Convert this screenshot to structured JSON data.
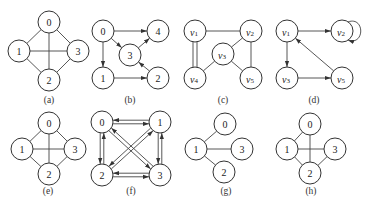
{
  "figure": {
    "panels": [
      {
        "id": "a",
        "caption": "(a)",
        "directed": false,
        "nodes": [
          {
            "id": "0",
            "label": "0",
            "x": 49,
            "y": 22
          },
          {
            "id": "1",
            "label": "1",
            "x": 19,
            "y": 51
          },
          {
            "id": "3",
            "label": "3",
            "x": 78,
            "y": 51
          },
          {
            "id": "2",
            "label": "2",
            "x": 49,
            "y": 80
          }
        ],
        "edges": [
          [
            "0",
            "1"
          ],
          [
            "0",
            "3"
          ],
          [
            "0",
            "2"
          ],
          [
            "1",
            "3"
          ],
          [
            "1",
            "2"
          ],
          [
            "2",
            "3"
          ]
        ],
        "caption_pos": {
          "x": 49,
          "y": 103
        }
      },
      {
        "id": "b",
        "caption": "(b)",
        "directed": true,
        "nodes": [
          {
            "id": "0",
            "label": "0",
            "x": 103,
            "y": 31
          },
          {
            "id": "4",
            "label": "4",
            "x": 158,
            "y": 31
          },
          {
            "id": "3",
            "label": "3",
            "x": 130,
            "y": 55
          },
          {
            "id": "1",
            "label": "1",
            "x": 103,
            "y": 78
          },
          {
            "id": "2",
            "label": "2",
            "x": 158,
            "y": 78
          }
        ],
        "edges": [
          [
            "0",
            "4"
          ],
          [
            "0",
            "3"
          ],
          [
            "0",
            "1"
          ],
          [
            "3",
            "4"
          ],
          [
            "2",
            "3"
          ],
          [
            "1",
            "2"
          ]
        ],
        "caption_pos": {
          "x": 130,
          "y": 103
        }
      },
      {
        "id": "c",
        "caption": "(c)",
        "directed": false,
        "nodes": [
          {
            "id": "v1",
            "label": "v",
            "sub": "1",
            "x": 195,
            "y": 31
          },
          {
            "id": "v2",
            "label": "v",
            "sub": "2",
            "x": 251,
            "y": 31
          },
          {
            "id": "v3",
            "label": "v",
            "sub": "3",
            "x": 223,
            "y": 54
          },
          {
            "id": "v4",
            "label": "v",
            "sub": "4",
            "x": 195,
            "y": 78
          },
          {
            "id": "v5",
            "label": "v",
            "sub": "5",
            "x": 251,
            "y": 78
          }
        ],
        "edges": [
          [
            "v1",
            "v2"
          ],
          [
            "v2",
            "v3"
          ],
          [
            "v2",
            "v5"
          ],
          [
            "v3",
            "v4"
          ],
          [
            "v3",
            "v5"
          ]
        ],
        "double_edges": [
          [
            "v1",
            "v4"
          ]
        ],
        "caption_pos": {
          "x": 223,
          "y": 103
        }
      },
      {
        "id": "d",
        "caption": "(d)",
        "directed": true,
        "nodes": [
          {
            "id": "v1",
            "label": "v",
            "sub": "1",
            "x": 287,
            "y": 31
          },
          {
            "id": "v2",
            "label": "v",
            "sub": "2",
            "x": 342,
            "y": 31
          },
          {
            "id": "v3",
            "label": "v",
            "sub": "3",
            "x": 287,
            "y": 78
          },
          {
            "id": "v5",
            "label": "v",
            "sub": "5",
            "x": 342,
            "y": 78
          }
        ],
        "edges": [
          [
            "v1",
            "v2"
          ],
          [
            "v1",
            "v3"
          ],
          [
            "v3",
            "v5"
          ],
          [
            "v5",
            "v1"
          ]
        ],
        "self_loops": [
          "v2"
        ],
        "caption_pos": {
          "x": 314,
          "y": 103
        }
      },
      {
        "id": "e",
        "caption": "(e)",
        "directed": false,
        "nodes": [
          {
            "id": "0",
            "label": "0",
            "x": 49,
            "y": 123
          },
          {
            "id": "1",
            "label": "1",
            "x": 22,
            "y": 149
          },
          {
            "id": "3",
            "label": "3",
            "x": 75,
            "y": 149
          },
          {
            "id": "2",
            "label": "2",
            "x": 49,
            "y": 174
          }
        ],
        "edges": [
          [
            "0",
            "1"
          ],
          [
            "0",
            "3"
          ],
          [
            "0",
            "2"
          ],
          [
            "1",
            "3"
          ],
          [
            "1",
            "2"
          ],
          [
            "2",
            "3"
          ]
        ],
        "caption_pos": {
          "x": 48,
          "y": 194
        }
      },
      {
        "id": "f",
        "caption": "(f)",
        "directed": true,
        "bidirectional": true,
        "nodes": [
          {
            "id": "0",
            "label": "0",
            "x": 102,
            "y": 122
          },
          {
            "id": "1",
            "label": "1",
            "x": 160,
            "y": 122
          },
          {
            "id": "2",
            "label": "2",
            "x": 102,
            "y": 175
          },
          {
            "id": "3",
            "label": "3",
            "x": 160,
            "y": 175
          }
        ],
        "edges": [
          [
            "0",
            "1"
          ],
          [
            "0",
            "2"
          ],
          [
            "0",
            "3"
          ],
          [
            "1",
            "2"
          ],
          [
            "1",
            "3"
          ],
          [
            "2",
            "3"
          ]
        ],
        "caption_pos": {
          "x": 131,
          "y": 194
        }
      },
      {
        "id": "g",
        "caption": "(g)",
        "directed": false,
        "nodes": [
          {
            "id": "0",
            "label": "0",
            "x": 225,
            "y": 124
          },
          {
            "id": "1",
            "label": "1",
            "x": 196,
            "y": 149
          },
          {
            "id": "3",
            "label": "3",
            "x": 242,
            "y": 149
          },
          {
            "id": "2",
            "label": "2",
            "x": 224,
            "y": 172
          }
        ],
        "edges": [
          [
            "0",
            "1"
          ],
          [
            "1",
            "3"
          ],
          [
            "1",
            "2"
          ]
        ],
        "caption_pos": {
          "x": 226,
          "y": 194
        }
      },
      {
        "id": "h",
        "caption": "(h)",
        "directed": false,
        "nodes": [
          {
            "id": "0",
            "label": "0",
            "x": 310,
            "y": 124
          },
          {
            "id": "1",
            "label": "1",
            "x": 287,
            "y": 149
          },
          {
            "id": "3",
            "label": "3",
            "x": 335,
            "y": 149
          },
          {
            "id": "2",
            "label": "2",
            "x": 310,
            "y": 173
          }
        ],
        "edges": [
          [
            "0",
            "1"
          ],
          [
            "0",
            "2"
          ],
          [
            "1",
            "3"
          ],
          [
            "1",
            "2"
          ],
          [
            "2",
            "3"
          ]
        ],
        "caption_pos": {
          "x": 311,
          "y": 194
        }
      }
    ],
    "node_radius": 11,
    "colors": {
      "stroke": "#333333",
      "edge": "#444444",
      "background": "#ffffff"
    }
  }
}
